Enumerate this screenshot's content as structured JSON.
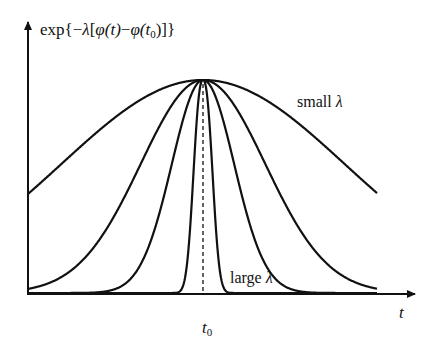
{
  "diagram": {
    "type": "curve-family",
    "y_axis_label": "exp{−λ[φ(t)−φ(t₀)]}",
    "y_axis_label_parts": {
      "prefix": "exp{−",
      "lambda": "λ",
      "bracket_open": "[",
      "phi1": "φ",
      "arg1": "(t)",
      "minus": "−",
      "phi2": "φ",
      "arg2_open": "(t",
      "arg2_sub": "0",
      "arg2_close": ")]}"
    },
    "x_axis_label": "t",
    "peak_label": "t",
    "peak_label_sub": "0",
    "annotations": {
      "small": {
        "text": "small ",
        "symbol": "λ"
      },
      "large": {
        "text": "large ",
        "symbol": "λ"
      }
    },
    "colors": {
      "stroke": "#111111",
      "background": "#ffffff"
    },
    "geometry": {
      "origin_x": 28,
      "baseline_y": 294,
      "peak_x": 203,
      "peak_y": 80,
      "x_axis_end": 415,
      "y_axis_top": 22,
      "curve_x_min": 28,
      "curve_x_max": 377
    },
    "curves": [
      {
        "name": "smallest-lambda",
        "width": 200,
        "power": 2
      },
      {
        "name": "lambda-2",
        "width": 88,
        "power": 2
      },
      {
        "name": "lambda-3",
        "width": 44,
        "power": 2
      },
      {
        "name": "largest-lambda",
        "width": 12,
        "power": 2.4
      }
    ]
  }
}
